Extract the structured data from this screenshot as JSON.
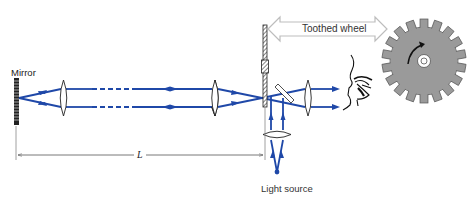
{
  "labels": {
    "mirror": "Mirror",
    "toothed_wheel": "Toothed wheel",
    "light_source": "Light source",
    "distance": "L"
  },
  "colors": {
    "beam": "#1f48a8",
    "outline": "#222222",
    "wheel_fill": "#9a9a9a",
    "arrow_outline": "#bdbdbd",
    "dimension_line": "#555555"
  },
  "icons": {
    "eye": "eye-icon",
    "wheel": "toothed-wheel-icon",
    "rotation": "rotation-arrow-icon"
  }
}
